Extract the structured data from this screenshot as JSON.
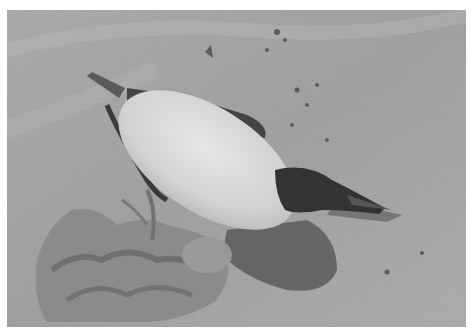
{
  "image": {
    "description": "Black-and-white photograph of a dead seabird (guillemot/auk) lying on its back on sand beside a clump of seaweed and debris",
    "subjects": [
      "dead seabird",
      "sand",
      "seaweed clump",
      "shadow",
      "pebbles"
    ],
    "palette": {
      "sand": "#a6a6a6",
      "sand_light": "#b8b8b8",
      "sand_dark": "#8e8e8e",
      "belly": "#dcdcdc",
      "wing": "#4a4a4a",
      "head": "#333333",
      "shadow": "#5f5f5f",
      "seaweed": "#7a7a7a",
      "border": "#ffffff"
    }
  }
}
